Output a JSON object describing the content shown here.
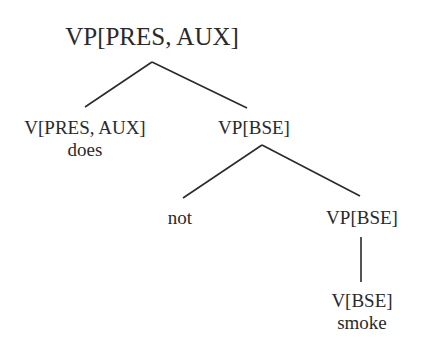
{
  "diagram": {
    "type": "syntax-tree",
    "root": {
      "label": "VP[PRES, AUX]"
    },
    "nodes": {
      "aux_verb": {
        "label": "V[PRES, AUX]",
        "word": "does"
      },
      "vp_bse_1": {
        "label": "VP[BSE]"
      },
      "neg": {
        "word": "not"
      },
      "vp_bse_2": {
        "label": "VP[BSE]"
      },
      "main_verb": {
        "label": "V[BSE]",
        "word": "smoke"
      }
    },
    "edges": [
      {
        "from": "VP[PRES, AUX]",
        "to": "V[PRES, AUX]"
      },
      {
        "from": "VP[PRES, AUX]",
        "to": "VP[BSE]"
      },
      {
        "from": "VP[BSE]",
        "to": "not"
      },
      {
        "from": "VP[BSE]",
        "to": "VP[BSE]"
      },
      {
        "from": "VP[BSE]",
        "to": "V[BSE]"
      }
    ],
    "colors": {
      "ink": "#2a2a2a",
      "background": "#ffffff"
    }
  }
}
